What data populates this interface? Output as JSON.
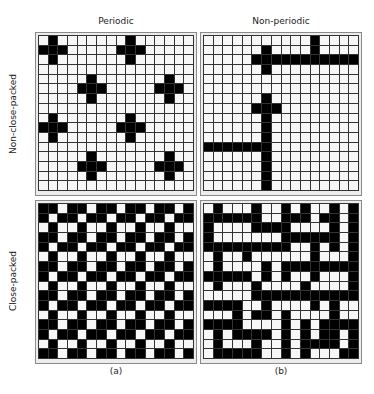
{
  "column_headers": [
    "Periodic",
    "Non-periodic"
  ],
  "row_headers": [
    "Non-close-packed",
    "Close-packed"
  ],
  "sub_labels": [
    "(a)",
    "(b)"
  ],
  "colors": {
    "filled": "#000000",
    "empty": "#f7f7f7",
    "grid_line": "#333333",
    "frame": "#8a8a8a"
  },
  "grid_size": 16,
  "panels": {
    "periodic_non_close_packed": {
      "description": "Plus-shaped clusters arranged periodically",
      "rows": [
        "0100000001000000",
        "1110000011100000",
        "0100000001000000",
        "0000000000000000",
        "0000010000000100",
        "0000111000001110",
        "0000010000000100",
        "0000000000000000",
        "0100000001000000",
        "1110000011100000",
        "0100000001000000",
        "0000000000000000",
        "0000010000000100",
        "0000111000001110",
        "0000010000000100",
        "0000000000000000"
      ]
    },
    "nonperiodic_non_close_packed": {
      "description": "Sparse branching chains without periodicity",
      "rows": [
        "0000000000010000",
        "0000001000010000",
        "0000011111111111",
        "0000001000000000",
        "0000000000000000",
        "0000000000000000",
        "0000001000000000",
        "0000011100000000",
        "0000001000000000",
        "0000001000000000",
        "0000001000000000",
        "1111111000000000",
        "0000001000000000",
        "0000001000000000",
        "0000001000000000",
        "0000001000000000"
      ]
    },
    "periodic_close_packed": {
      "description": "Dense periodic arrangement (period 3)",
      "rows": [
        "1101101101101101",
        "1011011011011011",
        "0100100100100100",
        "1101101101101101",
        "1011011011011011",
        "0100100100100100",
        "1101101101101101",
        "1011011011011011",
        "0100100100100100",
        "1101101101101101",
        "1011011011011011",
        "0100100100100100",
        "1101101101101101",
        "1011011011011011",
        "0100100100100100",
        "1101101101101101"
      ]
    },
    "nonperiodic_close_packed": {
      "description": "Dense random network without periodicity",
      "rows": [
        "0100010010100101",
        "1111110011101101",
        "1000011110000101",
        "1000000011111101",
        "1111111110010101",
        "0100100000010001",
        "0100001011111111",
        "1111101010010001",
        "0100010000100001",
        "0000011111111111",
        "1111001000010100",
        "0001011010000100",
        "1111000010101111",
        "0101111010101101",
        "0100010010111101",
        "0111110010100011"
      ]
    }
  }
}
